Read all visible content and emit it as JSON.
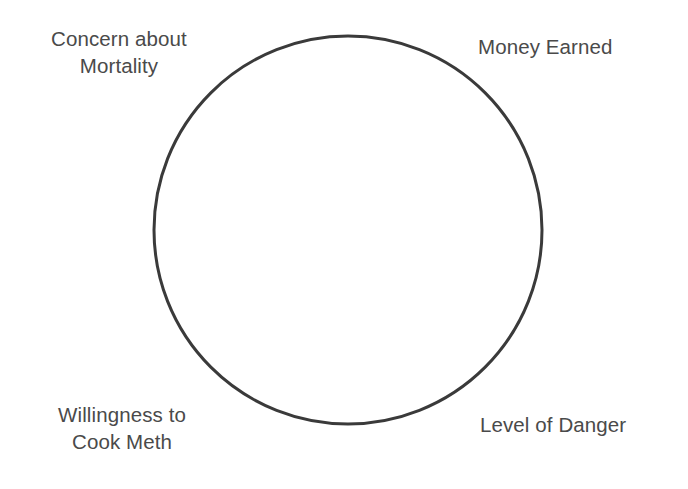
{
  "figure": {
    "type": "single-circle-diagram",
    "background_color": "#ffffff",
    "circle": {
      "center_x": 348,
      "center_y": 230,
      "radius": 194,
      "stroke_color": "#3a3a3a",
      "stroke_width": 3,
      "fill": "none"
    },
    "label_color": "#4a4a4a"
  },
  "labels": {
    "top_left": "Concern about\nMortality",
    "top_right": "Money Earned",
    "bottom_left": "Willingness to\nCook Meth",
    "bottom_right": "Level of Danger"
  }
}
